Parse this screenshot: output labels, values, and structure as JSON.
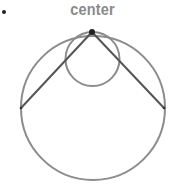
{
  "diagram": {
    "label": "center",
    "colors": {
      "stroke": "#8c8c8c",
      "chord": "#555555",
      "point": "#222222",
      "label": "#8a8a8a"
    },
    "large_circle": {
      "cx": 93,
      "cy": 108,
      "r": 72
    },
    "small_circle": {
      "cx": 92.5,
      "cy": 59,
      "r": 27
    },
    "top_point": {
      "x": 92,
      "y": 32
    },
    "chord_left_end": {
      "x": 21,
      "y": 108
    },
    "chord_right_end": {
      "x": 164,
      "y": 108
    }
  }
}
